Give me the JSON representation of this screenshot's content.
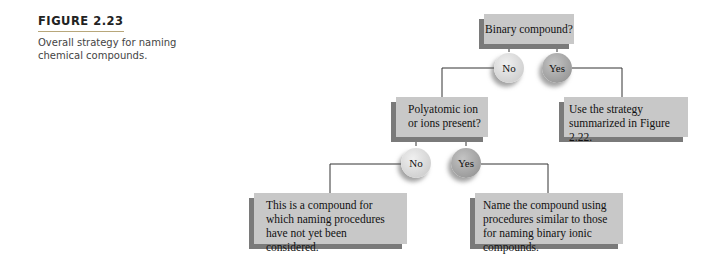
{
  "caption": {
    "label": "FIGURE 2.23",
    "text": "Overall strategy for naming chemical compounds."
  },
  "diagram": {
    "root": {
      "text": "Binary compound?"
    },
    "level1": {
      "no_label": "No",
      "yes_label": "Yes",
      "yes_result": "Use the strategy summarized in Figure 2.22.",
      "no_question": "Polyatomic ion or ions present?"
    },
    "level2": {
      "no_label": "No",
      "yes_label": "Yes",
      "no_result": "This is a compound for which naming procedures have not yet been considered.",
      "yes_result": "Name the compound using procedures similar to those for naming binary ionic compounds."
    },
    "colors": {
      "box_fill": "#c8c8c8",
      "box_shadow": "#7a7a7a",
      "no_circle": "#e0e0e0",
      "yes_circle": "#aaaaaa",
      "line": "#333333"
    }
  }
}
